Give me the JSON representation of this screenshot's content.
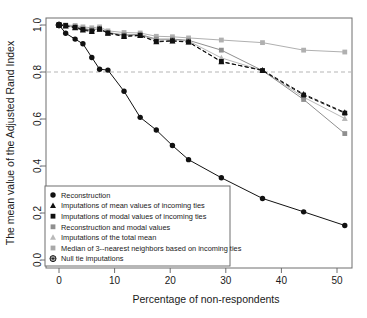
{
  "chart_data": {
    "type": "line",
    "title": "",
    "xlabel": "Percentage of non-respondents",
    "ylabel": "The mean value of the Adjusted Rand Index",
    "xlim": [
      -1.5,
      54
    ],
    "ylim": [
      0.0,
      1.02
    ],
    "xticks": [
      0,
      10,
      20,
      30,
      40,
      50
    ],
    "xtick_labels": [
      "0",
      "10",
      "20",
      "30",
      "40",
      "50"
    ],
    "yticks": [
      0.0,
      0.2,
      0.4,
      0.6,
      0.8,
      1.0
    ],
    "ytick_labels": [
      "0.0",
      "0.2",
      "0.4",
      "0.6",
      "0.8",
      "1.0"
    ],
    "grid": false,
    "reference_line": {
      "y": 0.8,
      "style": "dashed",
      "color": "#b5b5b5"
    },
    "legend_position": "bottom-left",
    "series": [
      {
        "name": "Reconstruction",
        "marker": "circle",
        "color": "#111111",
        "line": "solid",
        "x": [
          0,
          1.2,
          2.9,
          4.3,
          5.9,
          7.3,
          8.8,
          11.7,
          14.6,
          17.5,
          20.4,
          23.3,
          29.2,
          36.6,
          44.0,
          51.4
        ],
        "y": [
          1.0,
          0.965,
          0.94,
          0.92,
          0.862,
          0.812,
          0.808,
          0.718,
          0.607,
          0.553,
          0.487,
          0.427,
          0.35,
          0.262,
          0.205,
          0.147
        ]
      },
      {
        "name": "Imputations of mean values of incoming ties",
        "marker": "triangle",
        "color": "#111111",
        "line": "dashed",
        "x": [
          0,
          1.2,
          2.9,
          4.3,
          5.9,
          7.3,
          8.8,
          11.7,
          14.6,
          17.5,
          20.4,
          23.3,
          29.2,
          36.6,
          44.0,
          51.4
        ],
        "y": [
          1.0,
          0.995,
          0.988,
          0.978,
          0.972,
          0.982,
          0.965,
          0.951,
          0.955,
          0.928,
          0.932,
          0.927,
          0.843,
          0.808,
          0.706,
          0.628
        ]
      },
      {
        "name": "Imputations of modal values of incoming ties",
        "marker": "square",
        "color": "#111111",
        "line": "dashed",
        "x": [
          0,
          1.2,
          2.9,
          4.3,
          5.9,
          7.3,
          8.8,
          11.7,
          14.6,
          17.5,
          20.4,
          23.3,
          29.2,
          36.6,
          44.0,
          51.4
        ],
        "y": [
          1.0,
          0.998,
          0.99,
          0.981,
          0.975,
          0.983,
          0.966,
          0.953,
          0.956,
          0.93,
          0.933,
          0.928,
          0.845,
          0.806,
          0.702,
          0.625
        ]
      },
      {
        "name": "Reconstruction and modal values",
        "marker": "square",
        "color": "#8f8f8f",
        "line": "solid",
        "x": [
          0,
          1.2,
          2.9,
          4.3,
          5.9,
          7.3,
          8.8,
          11.7,
          14.6,
          17.5,
          20.4,
          23.3,
          29.2,
          36.6,
          44.0,
          51.4
        ],
        "y": [
          1.0,
          0.998,
          0.993,
          0.985,
          0.98,
          0.985,
          0.968,
          0.958,
          0.96,
          0.94,
          0.94,
          0.935,
          0.893,
          0.806,
          0.683,
          0.538
        ]
      },
      {
        "name": "Imputations of the total mean",
        "marker": "triangle",
        "color": "#b9b9b9",
        "line": "solid",
        "x": [
          0,
          1.2,
          2.9,
          4.3,
          5.9,
          7.3,
          8.8,
          11.7,
          14.6,
          17.5,
          20.4,
          23.3,
          29.2,
          36.6,
          44.0,
          51.4
        ],
        "y": [
          1.0,
          0.996,
          0.99,
          0.983,
          0.978,
          0.984,
          0.967,
          0.955,
          0.958,
          0.936,
          0.938,
          0.932,
          0.86,
          0.806,
          0.693,
          0.602
        ]
      },
      {
        "name": "Median of 3--nearest neighbors based on incoming ties",
        "marker": "square",
        "color": "#b0b0b0",
        "line": "solid",
        "x": [
          0,
          1.2,
          2.9,
          4.3,
          5.9,
          7.3,
          8.8,
          11.7,
          14.6,
          17.5,
          20.4,
          23.3,
          29.2,
          36.6,
          44.0,
          51.4
        ],
        "y": [
          1.0,
          1.0,
          0.998,
          0.992,
          0.988,
          0.992,
          0.975,
          0.968,
          0.966,
          0.952,
          0.95,
          0.945,
          0.936,
          0.925,
          0.893,
          0.885
        ]
      },
      {
        "name": "Null tie imputations",
        "marker": "circle-star",
        "color": "#111111",
        "line": "none",
        "x": [
          0
        ],
        "y": [
          1.0
        ]
      }
    ]
  },
  "legend": {
    "entries": [
      {
        "label": "Reconstruction",
        "marker": "circle",
        "color": "#111111"
      },
      {
        "label": "Imputations of mean values of incoming ties",
        "marker": "triangle",
        "color": "#111111"
      },
      {
        "label": "Imputations of modal values of incoming ties",
        "marker": "square",
        "color": "#111111"
      },
      {
        "label": "Reconstruction and modal values",
        "marker": "square",
        "color": "#8f8f8f"
      },
      {
        "label": "Imputations of the total mean",
        "marker": "triangle",
        "color": "#b9b9b9"
      },
      {
        "label": "Median of 3--nearest neighbors based on incoming ties",
        "marker": "square",
        "color": "#a8a8a8"
      },
      {
        "label": "Null tie imputations",
        "marker": "circle-star",
        "color": "#111111"
      }
    ]
  },
  "colors": {
    "frame": "#6e6e6e",
    "reference": "#b5b5b5",
    "text": "#1a1a1a"
  }
}
